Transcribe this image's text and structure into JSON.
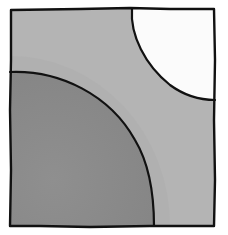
{
  "diagram": {
    "kind": "square-with-two-quarter-circles",
    "canvas": {
      "width": 228,
      "height": 235,
      "background": "#ffffff"
    },
    "square": {
      "x": 10,
      "y": 8,
      "width": 205,
      "height": 218,
      "fill": "#b3b3b3",
      "stroke": "#111111"
    },
    "regions": [
      {
        "name": "bottom-left-quarter-circle",
        "corner": "bottom-left",
        "fill": "#8b8b8b",
        "radius_x": 144,
        "radius_y": 154
      },
      {
        "name": "top-right-quarter-circle",
        "corner": "top-right",
        "fill": "#fbfbfb",
        "radius_x": 83,
        "radius_y": 92
      }
    ],
    "labels": []
  }
}
